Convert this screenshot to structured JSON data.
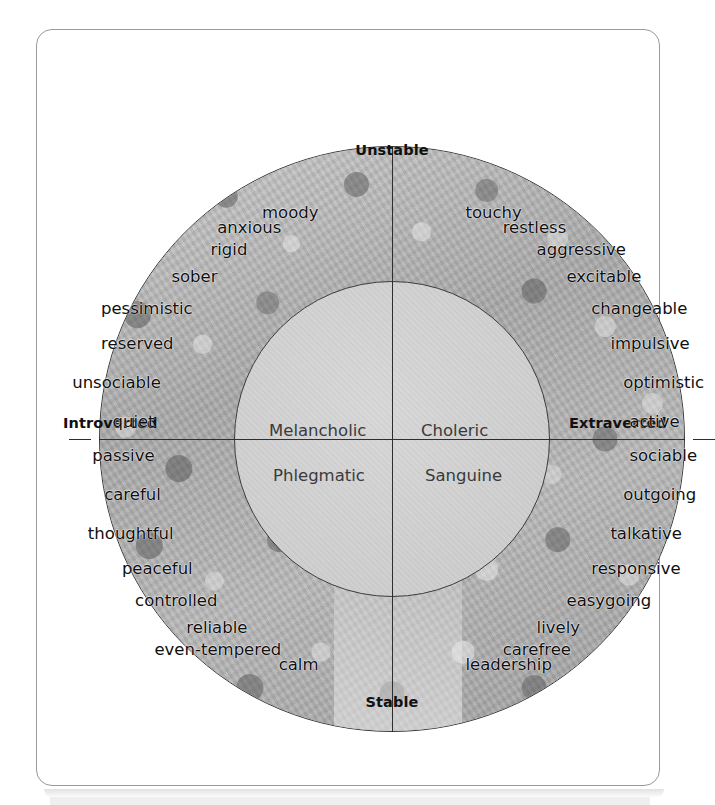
{
  "figure": {
    "axes": {
      "top": "Unstable",
      "bottom": "Stable",
      "left": "Introverted",
      "right": "Extraverted"
    },
    "temperaments": {
      "top_left": "Melancholic",
      "top_right": "Choleric",
      "bottom_left": "Phlegmatic",
      "bottom_right": "Sanguine"
    },
    "colors": {
      "frame_border": "#9a9a9a",
      "circle_outline": "#3b3b3b",
      "inner_fill": "#d2d2d2",
      "axis_line": "#2e2e2e",
      "text": "#0f0f0f",
      "temperament_text": "#3a3a3a",
      "ring_photo": "#a8a8a8"
    },
    "quadrants": {
      "melancholic": {
        "label": "Melancholic",
        "traits": [
          "moody",
          "anxious",
          "rigid",
          "sober",
          "pessimistic",
          "reserved",
          "unsociable",
          "quiet"
        ]
      },
      "choleric": {
        "label": "Choleric",
        "traits": [
          "touchy",
          "restless",
          "aggressive",
          "excitable",
          "changeable",
          "impulsive",
          "optimistic",
          "active"
        ]
      },
      "phlegmatic": {
        "label": "Phlegmatic",
        "traits": [
          "passive",
          "careful",
          "thoughtful",
          "peaceful",
          "controlled",
          "reliable",
          "even-tempered",
          "calm"
        ]
      },
      "sanguine": {
        "label": "Sanguine",
        "traits": [
          "sociable",
          "outgoing",
          "talkative",
          "responsive",
          "easygoing",
          "lively",
          "carefree",
          "leadership"
        ]
      }
    }
  },
  "chart_data": {
    "type": "scatter",
    "xlabel": "Introverted – Extraverted",
    "ylabel": "Stable – Unstable",
    "xlim": [
      -1,
      1
    ],
    "ylim": [
      -1,
      1
    ],
    "grid": false,
    "legend": "none",
    "annotations": [
      "Unstable",
      "Stable",
      "Introverted",
      "Extraverted"
    ],
    "series": [
      {
        "name": "Melancholic",
        "quadrant": "upper-left",
        "values": [
          "moody",
          "anxious",
          "rigid",
          "sober",
          "pessimistic",
          "reserved",
          "unsociable",
          "quiet"
        ]
      },
      {
        "name": "Choleric",
        "quadrant": "upper-right",
        "values": [
          "touchy",
          "restless",
          "aggressive",
          "excitable",
          "changeable",
          "impulsive",
          "optimistic",
          "active"
        ]
      },
      {
        "name": "Phlegmatic",
        "quadrant": "lower-left",
        "values": [
          "passive",
          "careful",
          "thoughtful",
          "peaceful",
          "controlled",
          "reliable",
          "even-tempered",
          "calm"
        ]
      },
      {
        "name": "Sanguine",
        "quadrant": "lower-right",
        "values": [
          "sociable",
          "outgoing",
          "talkative",
          "responsive",
          "easygoing",
          "lively",
          "carefree",
          "leadership"
        ]
      }
    ]
  }
}
